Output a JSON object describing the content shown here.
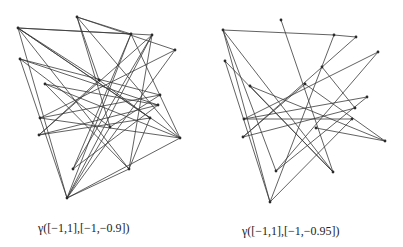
{
  "figures": [
    {
      "id": "left",
      "caption": "γ([−1,1],[−1,−0.9])",
      "vertices": [
        [
          18,
          28
        ],
        [
          77,
          17
        ],
        [
          131,
          34
        ],
        [
          152,
          35
        ],
        [
          175,
          50
        ],
        [
          20,
          59
        ],
        [
          45,
          84
        ],
        [
          99,
          80
        ],
        [
          160,
          95
        ],
        [
          158,
          105
        ],
        [
          40,
          118
        ],
        [
          39,
          135
        ],
        [
          180,
          138
        ],
        [
          150,
          118
        ],
        [
          110,
          127
        ],
        [
          73,
          169
        ],
        [
          129,
          169
        ],
        [
          67,
          198
        ]
      ],
      "edges": [
        [
          0,
          2
        ],
        [
          0,
          3
        ],
        [
          0,
          7
        ],
        [
          0,
          16
        ],
        [
          0,
          17
        ],
        [
          0,
          13
        ],
        [
          0,
          12
        ],
        [
          1,
          2
        ],
        [
          1,
          7
        ],
        [
          1,
          4
        ],
        [
          1,
          14
        ],
        [
          2,
          15
        ],
        [
          2,
          17
        ],
        [
          2,
          12
        ],
        [
          3,
          17
        ],
        [
          3,
          11
        ],
        [
          3,
          16
        ],
        [
          4,
          17
        ],
        [
          4,
          10
        ],
        [
          5,
          17
        ],
        [
          5,
          8
        ],
        [
          5,
          9
        ],
        [
          5,
          14
        ],
        [
          6,
          16
        ],
        [
          6,
          12
        ],
        [
          7,
          11
        ],
        [
          7,
          13
        ],
        [
          8,
          10
        ],
        [
          8,
          14
        ],
        [
          9,
          15
        ],
        [
          9,
          11
        ],
        [
          10,
          12
        ],
        [
          11,
          13
        ],
        [
          12,
          17
        ],
        [
          13,
          16
        ],
        [
          14,
          17
        ],
        [
          15,
          3
        ],
        [
          16,
          17
        ],
        [
          1,
          12
        ],
        [
          6,
          9
        ]
      ]
    },
    {
      "id": "right",
      "caption": "γ([−1,1],[−1,−0.95])",
      "vertices": [
        [
          223,
          30
        ],
        [
          281,
          20
        ],
        [
          334,
          35
        ],
        [
          356,
          37
        ],
        [
          378,
          52
        ],
        [
          225,
          61
        ],
        [
          250,
          86
        ],
        [
          305,
          84
        ],
        [
          322,
          67
        ],
        [
          367,
          97
        ],
        [
          355,
          108
        ],
        [
          352,
          119
        ],
        [
          244,
          119
        ],
        [
          243,
          137
        ],
        [
          316,
          128
        ],
        [
          385,
          141
        ],
        [
          276,
          171
        ],
        [
          333,
          172
        ],
        [
          270,
          202
        ]
      ],
      "edges": [
        [
          0,
          2
        ],
        [
          0,
          18
        ],
        [
          0,
          16
        ],
        [
          0,
          17
        ],
        [
          1,
          17
        ],
        [
          2,
          18
        ],
        [
          3,
          13
        ],
        [
          4,
          12
        ],
        [
          4,
          16
        ],
        [
          5,
          17
        ],
        [
          5,
          18
        ],
        [
          6,
          17
        ],
        [
          7,
          13
        ],
        [
          7,
          15
        ],
        [
          8,
          10
        ],
        [
          9,
          12
        ],
        [
          10,
          13
        ],
        [
          11,
          12
        ],
        [
          11,
          18
        ],
        [
          14,
          15
        ],
        [
          15,
          6
        ],
        [
          16,
          9
        ],
        [
          3,
          2
        ]
      ]
    }
  ]
}
